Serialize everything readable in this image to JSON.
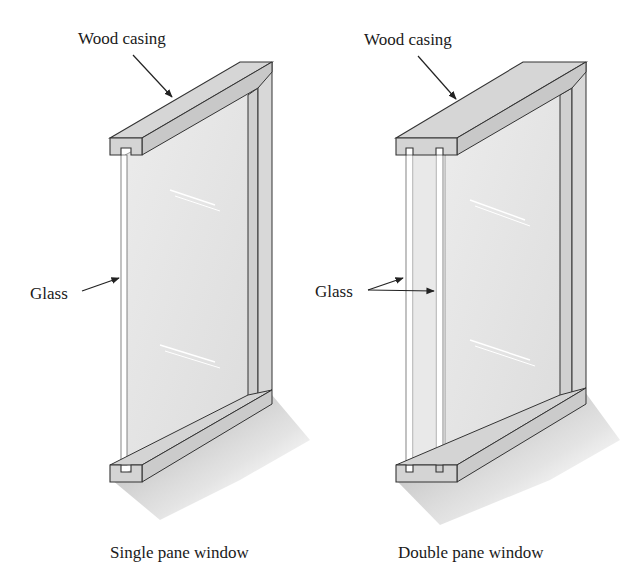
{
  "figure": {
    "panels": [
      {
        "id": "single",
        "caption": "Single pane window",
        "labels": {
          "casing": "Wood casing",
          "glass": "Glass"
        },
        "pane_count": 1
      },
      {
        "id": "double",
        "caption": "Double pane window",
        "labels": {
          "casing": "Wood casing",
          "glass": "Glass"
        },
        "pane_count": 2
      }
    ],
    "colors": {
      "wood": "#d6d6d6",
      "wood_dark": "#bdbdbd",
      "glass": "#e8e8e8",
      "outline": "#333333",
      "shadow": "#9a9a9a"
    }
  }
}
